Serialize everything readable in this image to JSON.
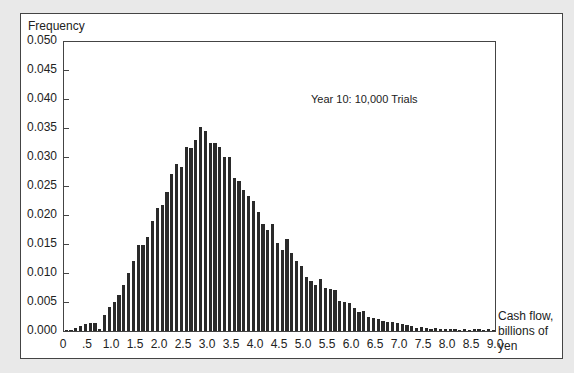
{
  "chart_data": {
    "type": "bar",
    "title": "",
    "ylabel": "Frequency",
    "xlabel": "Cash flow, billions of yen",
    "annotation": "Year 10: 10,000 Trials",
    "ylim": [
      0,
      0.05
    ],
    "xlim": [
      0,
      9.0
    ],
    "yticks": [
      "0.000",
      "0.005",
      "0.010",
      "0.015",
      "0.020",
      "0.025",
      "0.030",
      "0.035",
      "0.040",
      "0.045",
      "0.050"
    ],
    "xticks": [
      "0",
      ".5",
      "1.0",
      "1.5",
      "2.0",
      "2.5",
      "3.0",
      "3.5",
      "4.0",
      "4.5",
      "5.0",
      "5.5",
      "6.0",
      "6.5",
      "7.0",
      "7.5",
      "8.0",
      "8.5",
      "9.0"
    ],
    "bin_width": 0.1,
    "bin_starts": [
      0.0,
      0.1,
      0.2,
      0.3,
      0.4,
      0.5,
      0.6,
      0.7,
      0.8,
      0.9,
      1.0,
      1.1,
      1.2,
      1.3,
      1.4,
      1.5,
      1.6,
      1.7,
      1.8,
      1.9,
      2.0,
      2.1,
      2.2,
      2.3,
      2.4,
      2.5,
      2.6,
      2.7,
      2.8,
      2.9,
      3.0,
      3.1,
      3.2,
      3.3,
      3.4,
      3.5,
      3.6,
      3.7,
      3.8,
      3.9,
      4.0,
      4.1,
      4.2,
      4.3,
      4.4,
      4.5,
      4.6,
      4.7,
      4.8,
      4.9,
      5.0,
      5.1,
      5.2,
      5.3,
      5.4,
      5.5,
      5.6,
      5.7,
      5.8,
      5.9,
      6.0,
      6.1,
      6.2,
      6.3,
      6.4,
      6.5,
      6.6,
      6.7,
      6.8,
      6.9,
      7.0,
      7.1,
      7.2,
      7.3,
      7.4,
      7.5,
      7.6,
      7.7,
      7.8,
      7.9,
      8.0,
      8.1,
      8.2,
      8.3,
      8.4,
      8.5,
      8.6,
      8.7,
      8.8,
      8.9
    ],
    "values": [
      0.0002,
      0.0002,
      0.0005,
      0.0008,
      0.0012,
      0.0013,
      0.0013,
      0.0003,
      0.0028,
      0.0042,
      0.005,
      0.0062,
      0.008,
      0.01,
      0.012,
      0.0148,
      0.0148,
      0.0162,
      0.019,
      0.0212,
      0.0218,
      0.024,
      0.027,
      0.0288,
      0.0282,
      0.0318,
      0.0316,
      0.033,
      0.0352,
      0.0345,
      0.0325,
      0.0325,
      0.0318,
      0.03,
      0.03,
      0.0263,
      0.0258,
      0.0243,
      0.0233,
      0.0225,
      0.0205,
      0.0185,
      0.0175,
      0.0185,
      0.0152,
      0.014,
      0.0158,
      0.0135,
      0.012,
      0.0112,
      0.0093,
      0.0087,
      0.008,
      0.009,
      0.0075,
      0.0073,
      0.007,
      0.0052,
      0.005,
      0.0048,
      0.004,
      0.0032,
      0.0035,
      0.0025,
      0.0022,
      0.002,
      0.0018,
      0.0016,
      0.0015,
      0.0013,
      0.0012,
      0.001,
      0.0009,
      0.0005,
      0.0007,
      0.0005,
      0.0004,
      0.0005,
      0.0003,
      0.0004,
      0.0003,
      0.0003,
      0.0002,
      0.0003,
      0.0002,
      0.0004,
      0.0003,
      0.0002,
      0.0003,
      0.0002
    ],
    "grid": false,
    "legend": null,
    "bar_color": "#2a2a2a"
  },
  "labels": {
    "ylabel": "Frequency",
    "annotation": "Year 10: 10,000 Trials",
    "xlabel_line1": "Cash flow,",
    "xlabel_line2": "billions of",
    "xlabel_line3": "yen"
  }
}
